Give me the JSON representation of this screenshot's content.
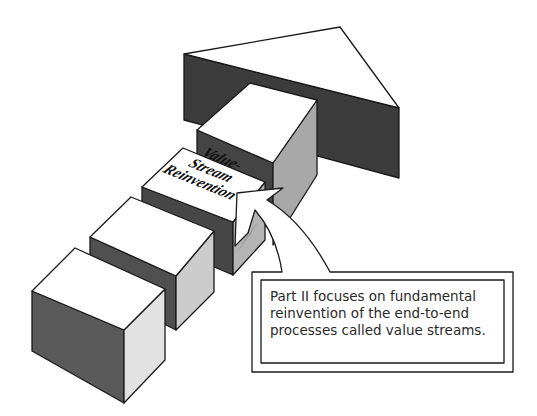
{
  "diagram": {
    "type": "3d-block-arrow",
    "highlighted_block": {
      "label_lines": [
        "Value-",
        "Stream",
        "Reinvention"
      ]
    },
    "callout": {
      "lines": [
        "Part II focuses on fundamental",
        "reinvention of the end-to-end",
        "processes called value streams."
      ]
    },
    "colors": {
      "top_face": "#ffffff",
      "front_face_dark": "#4a4a4a",
      "side_face_light": "#cfcfcf",
      "side_face_mid": "#9a9a9a",
      "arrowhead_side": "#3c3c3c",
      "outline": "#1a1a1a"
    }
  }
}
